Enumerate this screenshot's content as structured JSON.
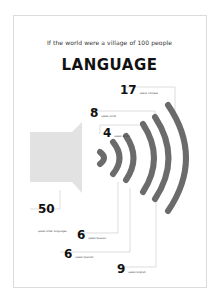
{
  "header": {
    "subtitle": "If the world were a village of 100 people",
    "title": "LANGUAGE"
  },
  "colors": {
    "speaker": "#e2e2e2",
    "waves": "#6b6b6b",
    "leader_lines": "#c8c8c8",
    "text": "#111111"
  },
  "icons": {
    "speaker": "speaker-icon",
    "sound_waves": "sound-waves-icon"
  },
  "stats": [
    {
      "value": "17",
      "label": "speak Chinese"
    },
    {
      "value": "8",
      "label": "speak Hindi"
    },
    {
      "value": "4",
      "label": "speak Arabic"
    },
    {
      "value": "50",
      "label": "speak other languages"
    },
    {
      "value": "6",
      "label": "speak Russian"
    },
    {
      "value": "6",
      "label": "speak Spanish"
    },
    {
      "value": "9",
      "label": "speak English"
    }
  ]
}
